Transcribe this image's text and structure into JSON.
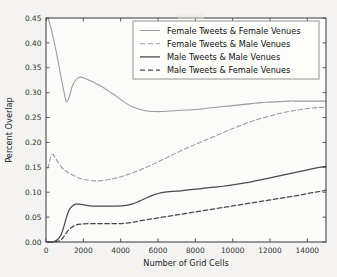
{
  "chart_data": {
    "type": "line",
    "title": "",
    "xlabel": "Number of Grid Cells",
    "ylabel": "Percent Overlap",
    "xlim": [
      0,
      15000
    ],
    "ylim": [
      0.0,
      0.45
    ],
    "xticks": [
      0,
      2000,
      4000,
      6000,
      8000,
      10000,
      12000,
      14000
    ],
    "xticklabels": [
      "0",
      "2000",
      "4000",
      "6000",
      "8000",
      "10000",
      "12000",
      "14000"
    ],
    "yticks": [
      0.0,
      0.05,
      0.1,
      0.15,
      0.2,
      0.25,
      0.3,
      0.35,
      0.4,
      0.45
    ],
    "yticklabels": [
      "0.00",
      "0.05",
      "0.10",
      "0.15",
      "0.20",
      "0.25",
      "0.30",
      "0.35",
      "0.40",
      "0.45"
    ],
    "grid": false,
    "legend_position": "upper center",
    "series": [
      {
        "name": "Female Tweets & Female Venues",
        "color": "#9a9a9a",
        "linestyle": "solid",
        "x": [
          100,
          250,
          400,
          550,
          700,
          850,
          1000,
          1100,
          1250,
          1400,
          1600,
          1800,
          2000,
          2300,
          2600,
          3000,
          3400,
          3800,
          4200,
          4600,
          5000,
          5400,
          5800,
          6200,
          6600,
          7000,
          7500,
          8000,
          8500,
          9000,
          9500,
          10000,
          10500,
          11000,
          11500,
          12000,
          12500,
          13000,
          13500,
          14000,
          14500,
          15000
        ],
        "y": [
          0.45,
          0.432,
          0.408,
          0.382,
          0.353,
          0.322,
          0.295,
          0.281,
          0.292,
          0.312,
          0.326,
          0.331,
          0.33,
          0.325,
          0.32,
          0.312,
          0.302,
          0.292,
          0.281,
          0.272,
          0.267,
          0.263,
          0.262,
          0.262,
          0.263,
          0.264,
          0.265,
          0.266,
          0.268,
          0.27,
          0.272,
          0.274,
          0.276,
          0.278,
          0.28,
          0.281,
          0.282,
          0.283,
          0.283,
          0.283,
          0.283,
          0.283
        ]
      },
      {
        "name": "Female Tweets & Male Venues",
        "color": "#9a9a9a",
        "linestyle": "dashed",
        "x": [
          100,
          250,
          350,
          450,
          600,
          800,
          1000,
          1200,
          1500,
          1800,
          2100,
          2500,
          2900,
          3300,
          3700,
          4100,
          4500,
          5000,
          5500,
          6000,
          6500,
          7000,
          7500,
          8000,
          8500,
          9000,
          9500,
          10000,
          10500,
          11000,
          11500,
          12000,
          12500,
          13000,
          13500,
          14000,
          14500,
          15000
        ],
        "y": [
          0.148,
          0.17,
          0.176,
          0.172,
          0.163,
          0.152,
          0.144,
          0.139,
          0.133,
          0.128,
          0.125,
          0.123,
          0.123,
          0.125,
          0.128,
          0.132,
          0.137,
          0.144,
          0.152,
          0.161,
          0.17,
          0.179,
          0.188,
          0.196,
          0.204,
          0.212,
          0.22,
          0.228,
          0.235,
          0.242,
          0.248,
          0.253,
          0.258,
          0.262,
          0.265,
          0.268,
          0.27,
          0.271
        ]
      },
      {
        "name": "Male Tweets & Male Venues",
        "color": "#4a4a4a",
        "linestyle": "solid",
        "x": [
          100,
          300,
          500,
          650,
          800,
          950,
          1100,
          1250,
          1400,
          1600,
          1800,
          2100,
          2500,
          3000,
          3400,
          3800,
          4200,
          4600,
          5000,
          5400,
          5800,
          6200,
          6600,
          7000,
          7500,
          8000,
          8500,
          9000,
          9500,
          10000,
          10500,
          11000,
          11500,
          12000,
          12500,
          13000,
          13500,
          14000,
          14500,
          15000
        ],
        "y": [
          0.0,
          0.0,
          0.002,
          0.006,
          0.014,
          0.03,
          0.05,
          0.065,
          0.072,
          0.076,
          0.076,
          0.074,
          0.072,
          0.072,
          0.072,
          0.072,
          0.073,
          0.076,
          0.082,
          0.089,
          0.095,
          0.099,
          0.101,
          0.102,
          0.104,
          0.106,
          0.108,
          0.11,
          0.112,
          0.115,
          0.118,
          0.121,
          0.125,
          0.129,
          0.133,
          0.137,
          0.141,
          0.145,
          0.149,
          0.152
        ]
      },
      {
        "name": "Male Tweets & Female Venues",
        "color": "#4a4a4a",
        "linestyle": "dashed",
        "x": [
          100,
          400,
          700,
          900,
          1050,
          1200,
          1400,
          1600,
          1900,
          2300,
          2700,
          3100,
          3500,
          3900,
          4300,
          4700,
          5100,
          5600,
          6100,
          6600,
          7100,
          7600,
          8100,
          8600,
          9100,
          9600,
          10100,
          10600,
          11100,
          11600,
          12100,
          12600,
          13100,
          13600,
          14100,
          14600,
          15000
        ],
        "y": [
          0.0,
          0.0,
          0.002,
          0.008,
          0.016,
          0.024,
          0.03,
          0.034,
          0.036,
          0.037,
          0.037,
          0.037,
          0.037,
          0.037,
          0.038,
          0.04,
          0.043,
          0.046,
          0.049,
          0.052,
          0.055,
          0.058,
          0.061,
          0.064,
          0.067,
          0.07,
          0.073,
          0.076,
          0.079,
          0.082,
          0.085,
          0.088,
          0.091,
          0.094,
          0.098,
          0.101,
          0.104
        ]
      }
    ]
  },
  "legend": {
    "items": [
      "Female Tweets & Female Venues",
      "Female Tweets & Male Venues",
      "Male Tweets & Male Venues",
      "Male Tweets & Female Venues"
    ]
  },
  "colors": {
    "light_line": "#9a9a9a",
    "dark_line": "#4a4a4a",
    "axis": "#4a4a4a",
    "background": "#f4f3f1",
    "plot_background": "#fbfbfa"
  }
}
